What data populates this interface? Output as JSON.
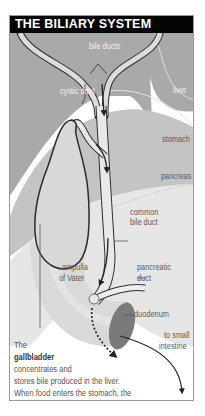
{
  "title": "THE BILIARY SYSTEM",
  "labels": {
    "bile_ducts": "bile ducts",
    "cystic_duct": "cystic duct",
    "liver": "liver",
    "stomach": "stomach",
    "pancreas": "pancreas",
    "common_bile_duct_1": "common",
    "common_bile_duct_2": "bile duct",
    "pancreatic_duct_1": "pancreatic",
    "pancreatic_duct_2": "duct",
    "ampulla_1": "ampulla",
    "ampulla_2": "of Vater",
    "duodenum": "duodenum",
    "to_small_intestine_1": "to small",
    "to_small_intestine_2": "intestine"
  },
  "caption": {
    "line1": "The",
    "line2_bold": "gallbladder",
    "line3": "concentrates and",
    "line4": "stores bile produced in the liver.",
    "line5": "When food enters the stomach, the",
    "line6": "gallbladder squeezes bile into the cystic duct."
  },
  "colors": {
    "title_bg": "#050505",
    "liver_gray": "#a9a9a9",
    "stomach_gray": "#c4c4c4",
    "pancreas_gray": "#e6e6e6",
    "duct_fill": "#e8e8e8",
    "duodenum_dark": "#7a7a7a"
  }
}
